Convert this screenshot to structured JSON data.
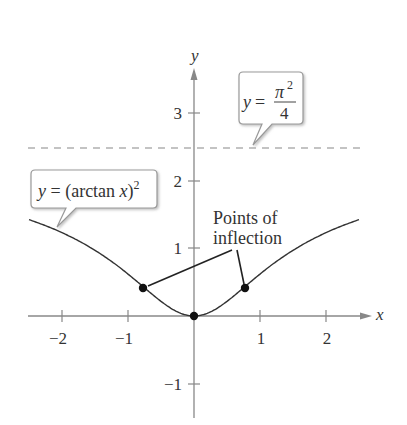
{
  "chart_data": {
    "type": "line",
    "title": "",
    "xlabel": "x",
    "ylabel": "y",
    "xlim": [
      -2.5,
      2.5
    ],
    "ylim": [
      -1.5,
      3.5
    ],
    "x_ticks": [
      -2,
      -1,
      1,
      2
    ],
    "x_tick_labels": [
      "−2",
      "−1",
      "1",
      "2"
    ],
    "y_ticks": [
      -1,
      1,
      2,
      3
    ],
    "y_tick_labels": [
      "−1",
      "1",
      "2",
      "3"
    ],
    "grid": false,
    "series": [
      {
        "name": "y = (arctan x)^2",
        "function": "(arctan x)^2",
        "x_range": [
          -2.5,
          2.5
        ]
      }
    ],
    "asymptote": {
      "name": "y = π^2/4",
      "y": 2.467,
      "style": "dashed"
    },
    "points": [
      {
        "label": "minimum",
        "x": 0,
        "y": 0
      },
      {
        "label": "inflection",
        "x": -0.577,
        "y": 0.274
      },
      {
        "label": "inflection",
        "x": 0.577,
        "y": 0.274
      }
    ],
    "annotations": [
      {
        "text": "y = π²/4",
        "target": "asymptote"
      },
      {
        "text": "y = (arctan x)²",
        "target": "curve"
      },
      {
        "text": "Points of inflection",
        "target": "inflection points"
      }
    ]
  },
  "labels": {
    "x_axis": "x",
    "y_axis": "y",
    "asym_y": "y",
    "asym_eq": "=",
    "asym_pi": "π",
    "asym_exp": "2",
    "asym_den": "4",
    "curve_label": "y = (arctan ",
    "curve_x": "x",
    "curve_close": ")",
    "curve_exp": "2",
    "poi_line1": "Points of",
    "poi_line2": "inflection",
    "tick_x_m2": "−2",
    "tick_x_m1": "−1",
    "tick_x_1": "1",
    "tick_x_2": "2",
    "tick_y_m1": "−1",
    "tick_y_1": "1",
    "tick_y_2": "2",
    "tick_y_3": "3"
  }
}
